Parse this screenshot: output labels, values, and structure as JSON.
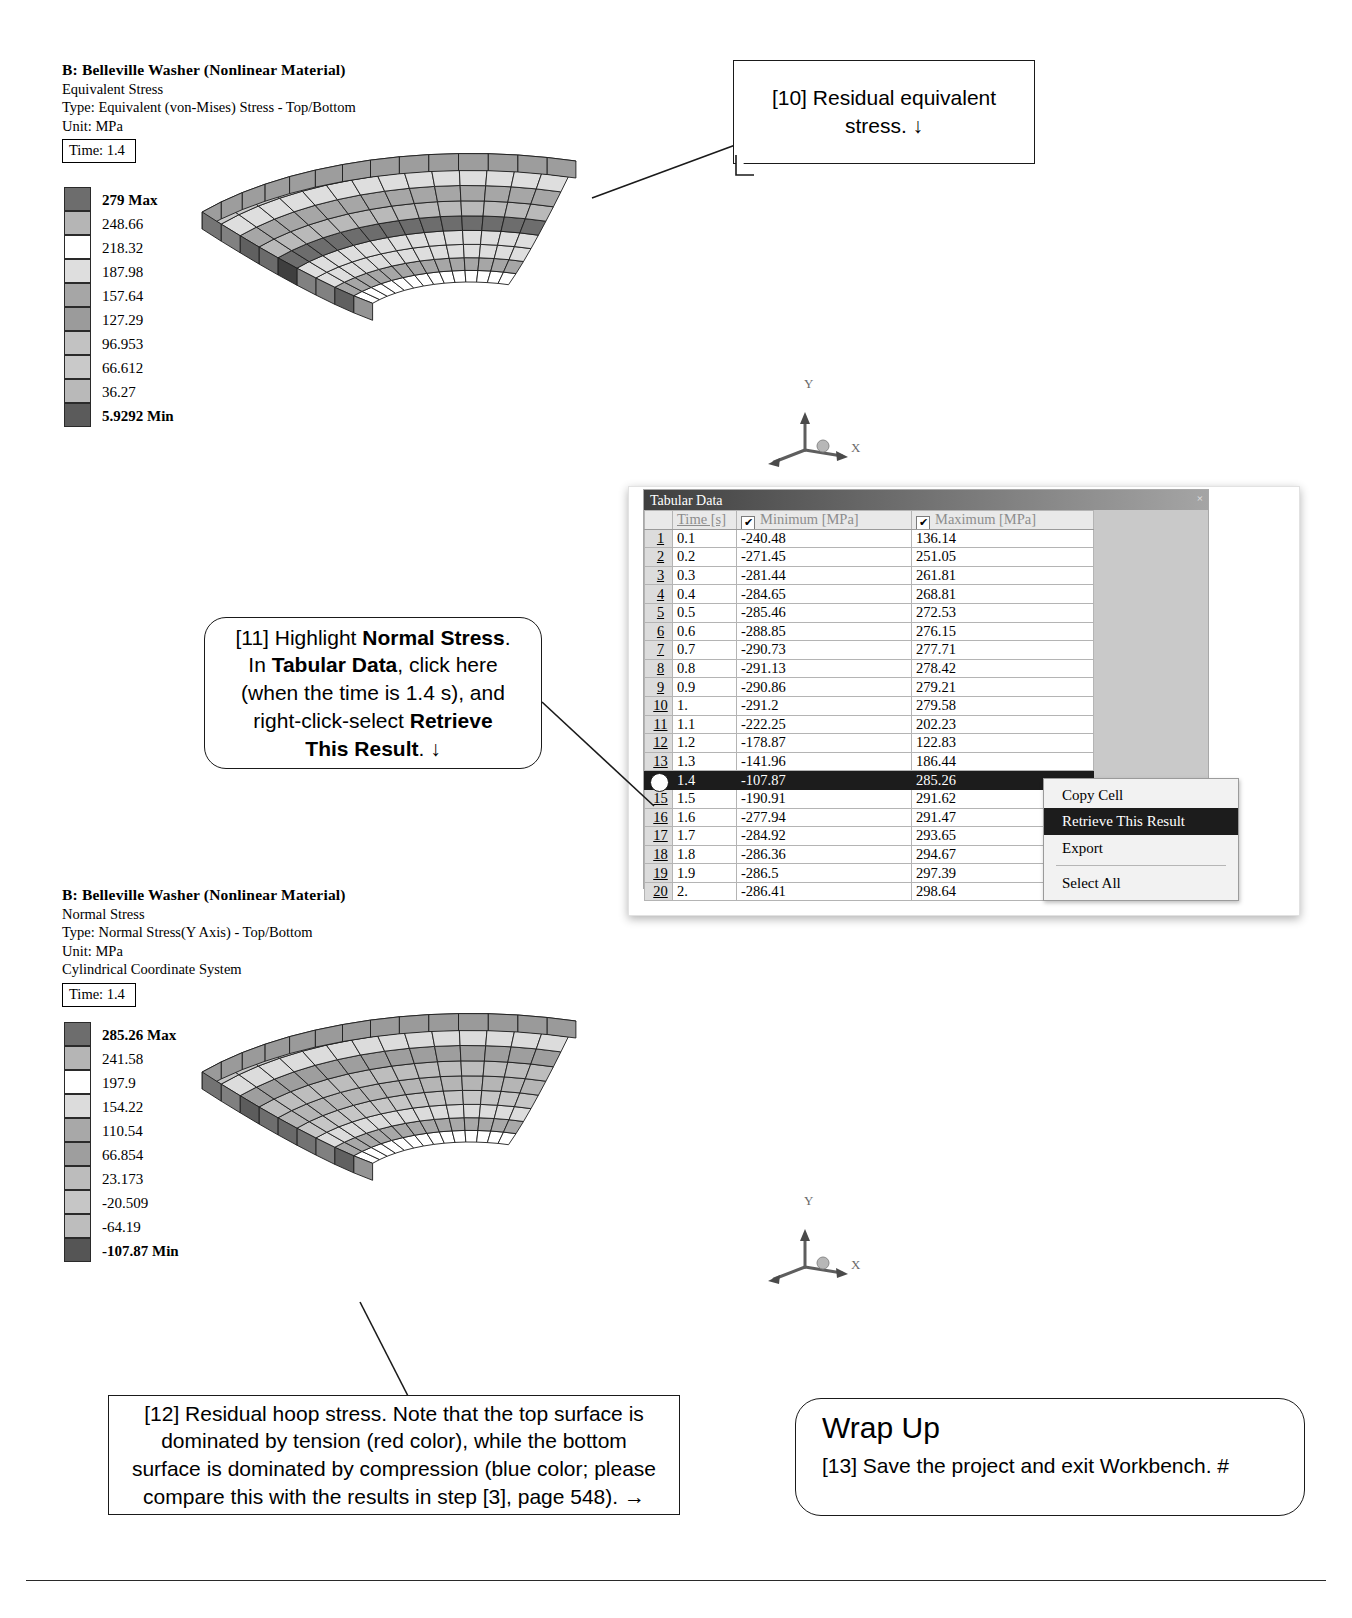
{
  "plot_top": {
    "title": "B: Belleville Washer (Nonlinear Material)",
    "result_name": "Equivalent Stress",
    "type_line": "Type: Equivalent (von-Mises) Stress - Top/Bottom",
    "unit_line": "Unit: MPa",
    "time_label": "Time: 1.4",
    "legend": [
      {
        "value": "279 Max",
        "color": "#6d6d6d"
      },
      {
        "value": "248.66",
        "color": "#b5b5b5"
      },
      {
        "value": "218.32",
        "color": "#ffffff"
      },
      {
        "value": "187.98",
        "color": "#dedede"
      },
      {
        "value": "157.64",
        "color": "#a6a6a6"
      },
      {
        "value": "127.29",
        "color": "#9b9b9b"
      },
      {
        "value": "96.953",
        "color": "#c2c2c2"
      },
      {
        "value": "66.612",
        "color": "#c9c9c9"
      },
      {
        "value": "36.27",
        "color": "#b9b9b9"
      },
      {
        "value": "5.9292 Min",
        "color": "#5b5b5b"
      }
    ],
    "triad": {
      "y": "Y",
      "x": "X"
    }
  },
  "plot_bottom": {
    "title": "B: Belleville Washer (Nonlinear Material)",
    "result_name": "Normal Stress",
    "type_line": "Type: Normal Stress(Y Axis) - Top/Bottom",
    "unit_line": "Unit: MPa",
    "coord_line": "Cylindrical Coordinate System",
    "time_label": "Time: 1.4",
    "legend": [
      {
        "value": "285.26 Max",
        "color": "#6d6d6d"
      },
      {
        "value": "241.58",
        "color": "#b5b5b5"
      },
      {
        "value": "197.9",
        "color": "#ffffff"
      },
      {
        "value": "154.22",
        "color": "#dcdcdc"
      },
      {
        "value": "110.54",
        "color": "#a8a8a8"
      },
      {
        "value": "66.854",
        "color": "#9e9e9e"
      },
      {
        "value": "23.173",
        "color": "#bcbcbc"
      },
      {
        "value": "-20.509",
        "color": "#c6c6c6"
      },
      {
        "value": "-64.19",
        "color": "#bdbdbd"
      },
      {
        "value": "-107.87 Min",
        "color": "#555555"
      }
    ],
    "triad": {
      "y": "Y",
      "x": "X"
    }
  },
  "tabular": {
    "panel_title": "Tabular Data",
    "close_glyph": "×",
    "columns": [
      "",
      "Time [s]",
      "Minimum [MPa]",
      "Maximum [MPa]"
    ],
    "check_glyph": "✔",
    "rows": [
      {
        "idx": "1",
        "time": "0.1",
        "min": "-240.48",
        "max": "136.14",
        "selected": false
      },
      {
        "idx": "2",
        "time": "0.2",
        "min": "-271.45",
        "max": "251.05",
        "selected": false
      },
      {
        "idx": "3",
        "time": "0.3",
        "min": "-281.44",
        "max": "261.81",
        "selected": false
      },
      {
        "idx": "4",
        "time": "0.4",
        "min": "-284.65",
        "max": "268.81",
        "selected": false
      },
      {
        "idx": "5",
        "time": "0.5",
        "min": "-285.46",
        "max": "272.53",
        "selected": false
      },
      {
        "idx": "6",
        "time": "0.6",
        "min": "-288.85",
        "max": "276.15",
        "selected": false
      },
      {
        "idx": "7",
        "time": "0.7",
        "min": "-290.73",
        "max": "277.71",
        "selected": false
      },
      {
        "idx": "8",
        "time": "0.8",
        "min": "-291.13",
        "max": "278.42",
        "selected": false
      },
      {
        "idx": "9",
        "time": "0.9",
        "min": "-290.86",
        "max": "279.21",
        "selected": false
      },
      {
        "idx": "10",
        "time": "1.",
        "min": "-291.2",
        "max": "279.58",
        "selected": false
      },
      {
        "idx": "11",
        "time": "1.1",
        "min": "-222.25",
        "max": "202.23",
        "selected": false
      },
      {
        "idx": "12",
        "time": "1.2",
        "min": "-178.87",
        "max": "122.83",
        "selected": false
      },
      {
        "idx": "13",
        "time": "1.3",
        "min": "-141.96",
        "max": "186.44",
        "selected": false
      },
      {
        "idx": "14",
        "time": "1.4",
        "min": "-107.87",
        "max": "285.26",
        "selected": true
      },
      {
        "idx": "15",
        "time": "1.5",
        "min": "-190.91",
        "max": "291.62",
        "selected": false
      },
      {
        "idx": "16",
        "time": "1.6",
        "min": "-277.94",
        "max": "291.47",
        "selected": false
      },
      {
        "idx": "17",
        "time": "1.7",
        "min": "-284.92",
        "max": "293.65",
        "selected": false
      },
      {
        "idx": "18",
        "time": "1.8",
        "min": "-286.36",
        "max": "294.67",
        "selected": false
      },
      {
        "idx": "19",
        "time": "1.9",
        "min": "-286.5",
        "max": "297.39",
        "selected": false
      },
      {
        "idx": "20",
        "time": "2.",
        "min": "-286.41",
        "max": "298.64",
        "selected": false
      }
    ]
  },
  "context_menu": {
    "items": [
      {
        "label": "Copy Cell",
        "highlighted": false,
        "separator_after": false
      },
      {
        "label": "Retrieve This Result",
        "highlighted": true,
        "separator_after": false
      },
      {
        "label": "Export",
        "highlighted": false,
        "separator_after": true
      },
      {
        "label": "Select All",
        "highlighted": false,
        "separator_after": false
      }
    ]
  },
  "callouts": {
    "step10": "[10] Residual equivalent stress.  ↓",
    "step11_l1_a": "[11] Highlight ",
    "step11_l1_b": "Normal Stress",
    "step11_l1_c": ".",
    "step11_l2_a": "In ",
    "step11_l2_b": "Tabular Data",
    "step11_l2_c": ", click here",
    "step11_l3": "(when the time is 1.4 s), and",
    "step11_l4_a": "right-click-select ",
    "step11_l4_b": "Retrieve",
    "step11_l5_b": "This Result",
    "step11_l5_c": ".  ↓",
    "step12_l1": "[12] Residual hoop stress.  Note that the top surface is",
    "step12_l2": "dominated by tension (red color), while the bottom",
    "step12_l3": "surface is dominated by compression (blue color; please",
    "step12_l4": "compare this with the results in step [3], page 548).  →"
  },
  "wrap_up": {
    "title": "Wrap Up",
    "body": "[13] Save the project and exit Workbench.  #"
  }
}
